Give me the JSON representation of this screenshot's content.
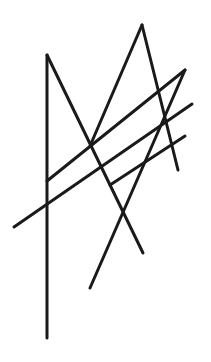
{
  "canvas": {
    "width": 211,
    "height": 362,
    "background": "#ffffff"
  },
  "stroke": {
    "color": "#1a1a1a",
    "width": 3
  },
  "lines": [
    {
      "id": "vertical",
      "x1": 47,
      "y1": 55,
      "x2": 47,
      "y2": 338
    },
    {
      "id": "left-diagonal",
      "x1": 47,
      "y1": 55,
      "x2": 143,
      "y2": 253
    },
    {
      "id": "peak-left",
      "x1": 90,
      "y1": 146,
      "x2": 142,
      "y2": 25
    },
    {
      "id": "peak-right",
      "x1": 142,
      "y1": 25,
      "x2": 178,
      "y2": 170
    },
    {
      "id": "upper-cross",
      "x1": 47,
      "y1": 181,
      "x2": 185,
      "y2": 70
    },
    {
      "id": "long-descender",
      "x1": 185,
      "y1": 70,
      "x2": 90,
      "y2": 288
    },
    {
      "id": "long-cross",
      "x1": 14,
      "y1": 227,
      "x2": 192,
      "y2": 104
    },
    {
      "id": "short-cross",
      "x1": 110,
      "y1": 185,
      "x2": 185,
      "y2": 136
    }
  ]
}
